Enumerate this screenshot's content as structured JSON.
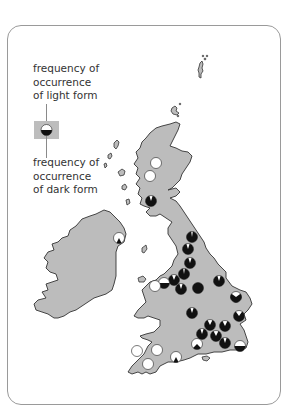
{
  "legend": {
    "top_label": "frequency of\noccurrence\nof light form",
    "bottom_label": "frequency of\noccurrence\nof dark form",
    "symbol_light_fraction": 0.5
  },
  "colors": {
    "land": "#bcbcbc",
    "coast": "#333333",
    "light_form": "#ffffff",
    "dark_form": "#111111",
    "frame": "#9a9a9a"
  },
  "sites": [
    {
      "region": "Scotland",
      "dark_fraction": 0.0
    },
    {
      "region": "Scotland",
      "dark_fraction": 0.0
    },
    {
      "region": "Scotland",
      "dark_fraction": 0.9
    },
    {
      "region": "Northern Ireland",
      "dark_fraction": 0.15
    },
    {
      "region": "Northern England",
      "dark_fraction": 0.95
    },
    {
      "region": "Northern England",
      "dark_fraction": 0.9
    },
    {
      "region": "Northern England",
      "dark_fraction": 0.9
    },
    {
      "region": "Northern England",
      "dark_fraction": 0.95
    },
    {
      "region": "Northern England",
      "dark_fraction": 0.88
    },
    {
      "region": "North Wales",
      "dark_fraction": 0.5
    },
    {
      "region": "North Wales",
      "dark_fraction": 0.0
    },
    {
      "region": "Midlands",
      "dark_fraction": 0.9
    },
    {
      "region": "Midlands",
      "dark_fraction": 1.0
    },
    {
      "region": "Lincolnshire",
      "dark_fraction": 0.9
    },
    {
      "region": "Norfolk",
      "dark_fraction": 0.7
    },
    {
      "region": "Midlands",
      "dark_fraction": 0.9
    },
    {
      "region": "Suffolk",
      "dark_fraction": 0.8
    },
    {
      "region": "South East",
      "dark_fraction": 0.85
    },
    {
      "region": "South East",
      "dark_fraction": 0.85
    },
    {
      "region": "South East",
      "dark_fraction": 0.9
    },
    {
      "region": "South East",
      "dark_fraction": 0.85
    },
    {
      "region": "South East",
      "dark_fraction": 0.9
    },
    {
      "region": "Kent",
      "dark_fraction": 0.5
    },
    {
      "region": "South",
      "dark_fraction": 0.25
    },
    {
      "region": "Dorset",
      "dark_fraction": 0.15
    },
    {
      "region": "South West",
      "dark_fraction": 0.0
    },
    {
      "region": "South West",
      "dark_fraction": 0.0
    },
    {
      "region": "South West",
      "dark_fraction": 0.0
    }
  ]
}
